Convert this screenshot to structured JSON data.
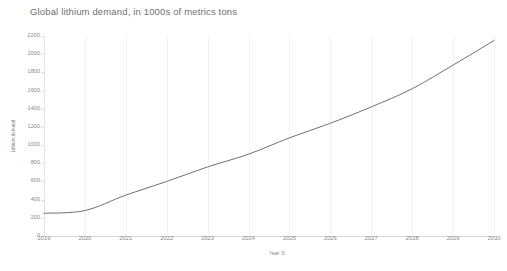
{
  "chart_data": {
    "type": "line",
    "title": "Global lithium demand, in 1000s of metrics tons",
    "xlabel": "Year",
    "ylabel": "Lithium demand",
    "x": [
      2019,
      2020,
      2021,
      2022,
      2023,
      2024,
      2025,
      2026,
      2027,
      2028,
      2029,
      2030
    ],
    "categories": [
      "2019",
      "2020",
      "2021",
      "2022",
      "2023",
      "2024",
      "2025",
      "2026",
      "2027",
      "2028",
      "2029",
      "2030"
    ],
    "series": [
      {
        "name": "Lithium demand",
        "values": [
          250,
          280,
          450,
          600,
          760,
          900,
          1080,
          1240,
          1420,
          1620,
          1880,
          2150
        ]
      }
    ],
    "ylim": [
      0,
      2200
    ],
    "xlim": [
      2019,
      2030
    ],
    "yticks": [
      0,
      200,
      400,
      600,
      800,
      1000,
      1200,
      1400,
      1600,
      1800,
      2000,
      2200
    ],
    "ytick_labels": [
      "0",
      "200",
      "400",
      "600",
      "800",
      "1000",
      "1200",
      "1400",
      "1600",
      "1800",
      "2000",
      "2200"
    ],
    "xtick_labels": [
      "2019",
      "2020",
      "2021",
      "2022",
      "2023",
      "2024",
      "2025",
      "2026",
      "2027",
      "2028",
      "2029",
      "2030"
    ],
    "grid": "vertical",
    "legend": "none",
    "line_color": "#707070",
    "grid_color": "#f2f2f2",
    "axis_color": "#e0e0e0",
    "background": "#ffffff",
    "sort_indicator": "⇅"
  }
}
